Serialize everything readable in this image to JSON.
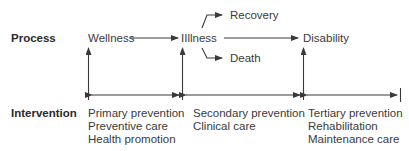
{
  "rows": {
    "process_label": "Process",
    "intervention_label": "Intervention"
  },
  "process": {
    "wellness": "Wellness",
    "illness": "IIllness",
    "recovery": "Recovery",
    "death": "Death",
    "disability": "Disability"
  },
  "interventions": [
    {
      "lines": [
        "Primary prevention",
        "Preventive care",
        "Health promotion"
      ]
    },
    {
      "lines": [
        "Secondary prevention",
        "Clinical care"
      ]
    },
    {
      "lines": [
        "Tertiary prevention",
        "Rehabilitation",
        "Maintenance care"
      ]
    }
  ],
  "colors": {
    "line": "#3a3a3a",
    "text": "#3a3a3a"
  }
}
